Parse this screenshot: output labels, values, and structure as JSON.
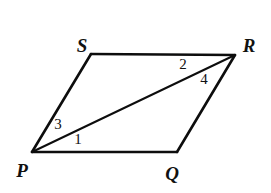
{
  "figure": {
    "kind": "geometry-diagram",
    "shape_name": "parallelogram",
    "background_color": "#ffffff",
    "stroke_color": "#0d0d0d",
    "width": 271,
    "height": 193
  },
  "vertices": [
    {
      "id": "P",
      "label": "P",
      "x": 32,
      "y": 152,
      "label_x": 22,
      "label_y": 170
    },
    {
      "id": "Q",
      "label": "Q",
      "x": 177,
      "y": 152,
      "label_x": 172,
      "label_y": 173
    },
    {
      "id": "R",
      "label": "R",
      "x": 235,
      "y": 55,
      "label_x": 249,
      "label_y": 45
    },
    {
      "id": "S",
      "label": "S",
      "x": 91,
      "y": 54,
      "label_x": 82,
      "label_y": 45
    }
  ],
  "edges": [
    {
      "id": "PQ",
      "from": "P",
      "to": "Q"
    },
    {
      "id": "QR",
      "from": "Q",
      "to": "R"
    },
    {
      "id": "RS",
      "from": "R",
      "to": "S"
    },
    {
      "id": "SP",
      "from": "S",
      "to": "P"
    }
  ],
  "diagonals": [
    {
      "id": "PR",
      "from": "P",
      "to": "R"
    }
  ],
  "angle_labels": [
    {
      "id": "angle-1",
      "label": "1",
      "x": 78,
      "y": 139,
      "at_vertex": "P"
    },
    {
      "id": "angle-2",
      "label": "2",
      "x": 183,
      "y": 64,
      "at_vertex": "R"
    },
    {
      "id": "angle-3",
      "label": "3",
      "x": 58,
      "y": 124,
      "at_vertex": "P"
    },
    {
      "id": "angle-4",
      "label": "4",
      "x": 204,
      "y": 79,
      "at_vertex": "R"
    }
  ]
}
